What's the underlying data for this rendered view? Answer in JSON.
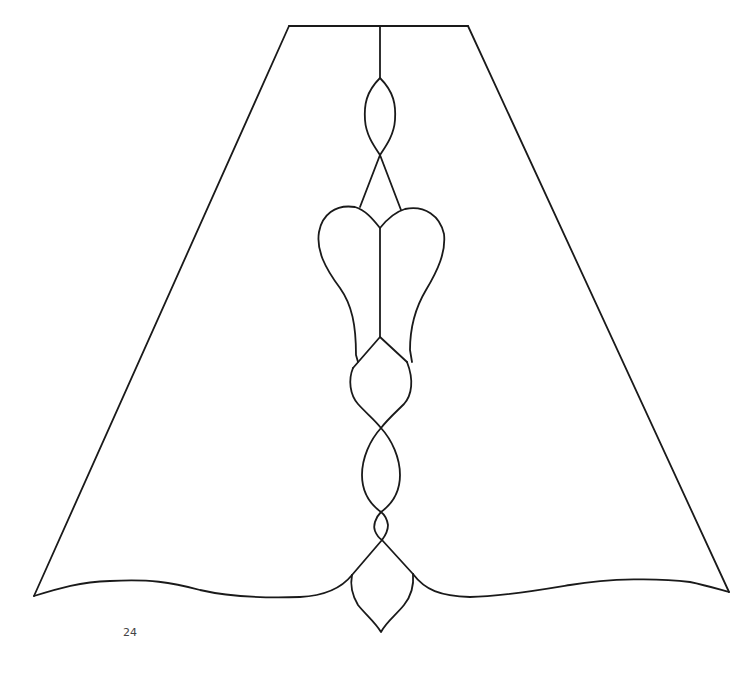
{
  "figure": {
    "stroke_color": "#1a1a1a",
    "background": "#ffffff"
  },
  "page": {
    "number": "24"
  }
}
